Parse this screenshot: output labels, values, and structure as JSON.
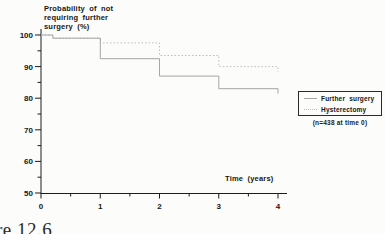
{
  "figure": {
    "title": "Probability of not\nrequiring further\nsurgery (%)",
    "xaxis_title": "Time (years)",
    "sample_size_note": "(n=438 at time 0)",
    "caption": "re 12.6"
  },
  "chart_data": {
    "type": "line",
    "subtype": "step-survival",
    "title": "Probability of not requiring further surgery (%)",
    "xlabel": "Time (years)",
    "ylabel": "Probability of not requiring further surgery (%)",
    "xlim": [
      0,
      4
    ],
    "ylim": [
      50,
      100
    ],
    "x_ticks": [
      "0",
      "1",
      "2",
      "3",
      "4"
    ],
    "x_tick_values": [
      0,
      1,
      2,
      3,
      4
    ],
    "x_minor_tick_values": [
      0.5,
      1.5,
      2.5,
      3.5
    ],
    "y_ticks": [
      "100",
      "90",
      "80",
      "70",
      "60",
      "50"
    ],
    "y_tick_values": [
      100,
      90,
      80,
      70,
      60,
      50
    ],
    "y_minor_tick_values": [
      55,
      65,
      75,
      85,
      95
    ],
    "grid": false,
    "legend_position": "right-middle",
    "annotation": "(n=438 at time 0)",
    "axis_color": "#1c1c1c",
    "series": [
      {
        "name": "Hysterectomy",
        "style": "dotted",
        "color": "#bdbdbd",
        "end_tick": true,
        "steps": [
          [
            0,
            100
          ],
          [
            0.2,
            99
          ],
          [
            1,
            97.5
          ],
          [
            2,
            93.5
          ],
          [
            3,
            90
          ],
          [
            4,
            90
          ]
        ]
      },
      {
        "name": "Further surgery",
        "style": "solid",
        "color": "#a6a6a6",
        "end_tick": true,
        "steps": [
          [
            0,
            100
          ],
          [
            0.2,
            99
          ],
          [
            1,
            92.5
          ],
          [
            2,
            87
          ],
          [
            3,
            83
          ],
          [
            4,
            83
          ]
        ]
      }
    ],
    "legend_order": [
      "Further surgery",
      "Hysterectomy"
    ]
  }
}
